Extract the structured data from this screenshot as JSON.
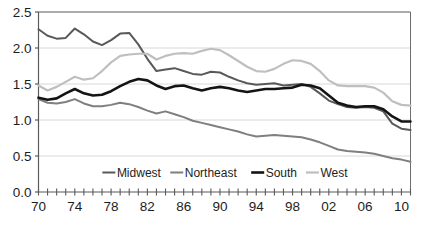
{
  "chart_data": {
    "type": "line",
    "title": "",
    "xlabel": "",
    "ylabel": "",
    "xlim": [
      1970,
      2011
    ],
    "ylim": [
      0.0,
      2.5
    ],
    "grid": true,
    "grid_axis": "y",
    "legend_position": "inside-bottom-center",
    "y_ticks": [
      "0.0",
      "0.5",
      "1.0",
      "1.5",
      "2.0",
      "2.5"
    ],
    "y_tick_values": [
      0.0,
      0.5,
      1.0,
      1.5,
      2.0,
      2.5
    ],
    "x_tick_labels": [
      "70",
      "74",
      "78",
      "82",
      "86",
      "90",
      "94",
      "98",
      "02",
      "06",
      "10"
    ],
    "x_tick_values": [
      1970,
      1974,
      1978,
      1982,
      1986,
      1990,
      1994,
      1998,
      2002,
      2006,
      2010
    ],
    "x_minor_tick_interval": 1,
    "x": [
      1970,
      1971,
      1972,
      1973,
      1974,
      1975,
      1976,
      1977,
      1978,
      1979,
      1980,
      1981,
      1982,
      1983,
      1984,
      1985,
      1986,
      1987,
      1988,
      1989,
      1990,
      1991,
      1992,
      1993,
      1994,
      1995,
      1996,
      1997,
      1998,
      1999,
      2000,
      2001,
      2002,
      2003,
      2004,
      2005,
      2006,
      2007,
      2008,
      2009,
      2010,
      2011
    ],
    "series": [
      {
        "name": "Midwest",
        "color": "#595959",
        "width": 2.0,
        "values": [
          2.26,
          2.17,
          2.13,
          2.14,
          2.27,
          2.19,
          2.09,
          2.04,
          2.11,
          2.2,
          2.21,
          2.05,
          1.85,
          1.68,
          1.7,
          1.72,
          1.68,
          1.64,
          1.63,
          1.67,
          1.66,
          1.6,
          1.55,
          1.51,
          1.49,
          1.5,
          1.51,
          1.48,
          1.49,
          1.5,
          1.46,
          1.37,
          1.27,
          1.22,
          1.18,
          1.17,
          1.18,
          1.17,
          1.12,
          0.95,
          0.88,
          0.86
        ]
      },
      {
        "name": "Northeast",
        "color": "#7f7f7f",
        "width": 2.0,
        "values": [
          1.29,
          1.24,
          1.23,
          1.25,
          1.29,
          1.23,
          1.19,
          1.19,
          1.21,
          1.24,
          1.22,
          1.18,
          1.13,
          1.09,
          1.12,
          1.08,
          1.04,
          0.99,
          0.96,
          0.93,
          0.9,
          0.87,
          0.84,
          0.8,
          0.77,
          0.78,
          0.79,
          0.78,
          0.77,
          0.76,
          0.73,
          0.69,
          0.64,
          0.59,
          0.57,
          0.56,
          0.55,
          0.53,
          0.5,
          0.47,
          0.45,
          0.42
        ]
      },
      {
        "name": "South",
        "color": "#141414",
        "width": 2.6,
        "values": [
          1.31,
          1.28,
          1.3,
          1.37,
          1.43,
          1.37,
          1.34,
          1.35,
          1.4,
          1.47,
          1.53,
          1.57,
          1.55,
          1.48,
          1.43,
          1.47,
          1.48,
          1.44,
          1.41,
          1.44,
          1.46,
          1.44,
          1.41,
          1.39,
          1.41,
          1.43,
          1.43,
          1.44,
          1.45,
          1.49,
          1.48,
          1.44,
          1.34,
          1.24,
          1.2,
          1.18,
          1.19,
          1.19,
          1.15,
          1.05,
          0.98,
          0.98
        ]
      },
      {
        "name": "West",
        "color": "#bfbfbf",
        "width": 2.2,
        "values": [
          1.48,
          1.41,
          1.46,
          1.53,
          1.6,
          1.56,
          1.58,
          1.68,
          1.8,
          1.89,
          1.91,
          1.92,
          1.92,
          1.84,
          1.89,
          1.92,
          1.93,
          1.92,
          1.96,
          1.99,
          1.97,
          1.9,
          1.82,
          1.74,
          1.68,
          1.67,
          1.71,
          1.78,
          1.83,
          1.82,
          1.78,
          1.68,
          1.55,
          1.48,
          1.47,
          1.47,
          1.47,
          1.45,
          1.38,
          1.26,
          1.21,
          1.2
        ]
      }
    ]
  },
  "legend": {
    "entries": [
      {
        "label": "Midwest"
      },
      {
        "label": "Northeast"
      },
      {
        "label": "South"
      },
      {
        "label": "West"
      }
    ]
  },
  "caption": {
    "text": ""
  }
}
